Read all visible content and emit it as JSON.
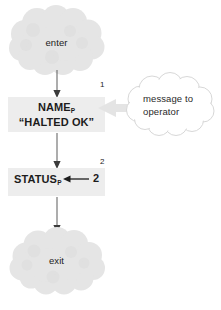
{
  "diagram": {
    "type": "flowchart",
    "title": "",
    "background_color": "#ffffff",
    "nodes": [
      {
        "id": "enter",
        "shape": "cloud",
        "label": "enter",
        "fill_color": "#e6e6e6",
        "text_color": "#1c1c1c"
      },
      {
        "id": "name-process",
        "shape": "rectangle",
        "line_1": "NAME",
        "line_1_subscript": "P",
        "line_2": "“HALTED OK”",
        "fill_color": "#ececec",
        "text_color": "#1c1c1c"
      },
      {
        "id": "status-process",
        "shape": "rectangle",
        "line_1": "STATUS",
        "line_1_subscript": "P",
        "argument": "2",
        "fill_color": "#ececec",
        "text_color": "#1c1c1c"
      },
      {
        "id": "exit",
        "shape": "cloud",
        "label": "exit",
        "fill_color": "#e6e6e6",
        "text_color": "#1c1c1c"
      },
      {
        "id": "message-cloud",
        "shape": "cloud-outline",
        "line_1": "message to",
        "line_2": "operator",
        "fill_color": "#ffffff",
        "stroke_color": "#cfcfcf",
        "text_color": "#2a2a2a"
      }
    ],
    "edges": [
      {
        "id": "enter-to-name",
        "from": "enter",
        "to": "name-process",
        "label": "",
        "direction": "down",
        "color": "#5a5a5a"
      },
      {
        "id": "name-to-status",
        "from": "name-process",
        "to": "status-process",
        "label": "",
        "direction": "down",
        "color": "#5a5a5a"
      },
      {
        "id": "status-to-exit",
        "from": "status-process",
        "to": "exit",
        "label": "",
        "direction": "down",
        "color": "#5a5a5a"
      },
      {
        "id": "message-to-name",
        "from": "message-cloud",
        "to": "name-process",
        "label": "",
        "direction": "left",
        "color": "#e2e2e2"
      },
      {
        "id": "status-argument-arrow",
        "from": "status-arg-2",
        "to": "status-process",
        "label": "2",
        "direction": "left",
        "color": "#1c1c1c"
      }
    ],
    "edge_labels": {
      "step_1": "1",
      "step_2": "2"
    }
  }
}
